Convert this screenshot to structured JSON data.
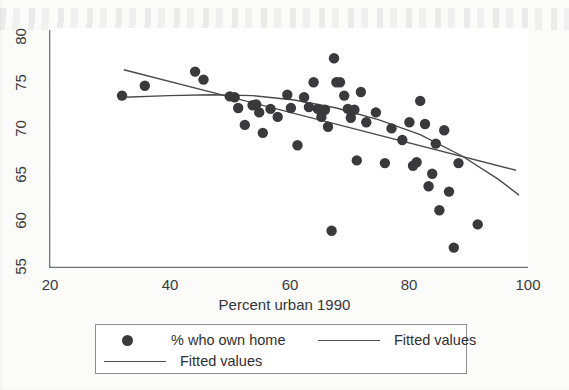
{
  "chart_data": {
    "type": "scatter",
    "title": "",
    "xlabel": "Percent urban 1990",
    "ylabel": "",
    "xlim": [
      20,
      100
    ],
    "ylim": [
      54,
      81
    ],
    "xticks": [
      20,
      40,
      60,
      80,
      100
    ],
    "yticks": [
      55,
      60,
      65,
      70,
      75,
      80
    ],
    "grid": false,
    "legend_position": "bottom",
    "marker_color": "#3a3a3c",
    "line_color": "#4a4a4e",
    "series": [
      {
        "name": "% who own home",
        "type": "scatter",
        "points": [
          [
            32.2,
            73.4
          ],
          [
            36.0,
            74.5
          ],
          [
            44.4,
            76.1
          ],
          [
            45.8,
            75.2
          ],
          [
            50.2,
            73.3
          ],
          [
            51.0,
            73.2
          ],
          [
            51.6,
            72.0
          ],
          [
            52.7,
            70.1
          ],
          [
            54.0,
            72.3
          ],
          [
            54.6,
            72.4
          ],
          [
            55.1,
            71.5
          ],
          [
            55.7,
            69.2
          ],
          [
            57.0,
            71.9
          ],
          [
            58.2,
            71.0
          ],
          [
            59.8,
            73.5
          ],
          [
            60.4,
            72.0
          ],
          [
            61.5,
            67.8
          ],
          [
            62.6,
            73.2
          ],
          [
            63.4,
            72.1
          ],
          [
            64.2,
            74.9
          ],
          [
            64.9,
            71.9
          ],
          [
            65.5,
            71.0
          ],
          [
            66.1,
            71.8
          ],
          [
            66.6,
            69.9
          ],
          [
            67.2,
            58.2
          ],
          [
            67.6,
            77.6
          ],
          [
            68.0,
            74.9
          ],
          [
            68.6,
            74.9
          ],
          [
            69.3,
            73.4
          ],
          [
            69.9,
            71.9
          ],
          [
            70.4,
            70.9
          ],
          [
            71.0,
            71.8
          ],
          [
            71.4,
            66.1
          ],
          [
            72.1,
            73.8
          ],
          [
            73.0,
            70.4
          ],
          [
            74.6,
            71.5
          ],
          [
            76.1,
            65.8
          ],
          [
            77.2,
            69.7
          ],
          [
            79.0,
            68.4
          ],
          [
            80.2,
            70.4
          ],
          [
            80.8,
            65.5
          ],
          [
            81.4,
            65.9
          ],
          [
            82.0,
            72.8
          ],
          [
            82.8,
            70.2
          ],
          [
            83.4,
            63.2
          ],
          [
            84.0,
            64.6
          ],
          [
            84.6,
            68.0
          ],
          [
            85.2,
            60.5
          ],
          [
            86.0,
            69.5
          ],
          [
            86.8,
            62.6
          ],
          [
            87.6,
            56.3
          ],
          [
            88.4,
            65.8
          ],
          [
            91.6,
            58.9
          ]
        ]
      },
      {
        "name": "Fitted values",
        "type": "line",
        "style": "linear",
        "points": [
          [
            32.5,
            76.3
          ],
          [
            98.0,
            65.0
          ]
        ]
      },
      {
        "name": "Fitted values",
        "type": "line",
        "style": "quadratic",
        "points": [
          [
            32.5,
            73.2
          ],
          [
            40,
            73.4
          ],
          [
            47,
            73.5
          ],
          [
            54,
            73.4
          ],
          [
            61,
            72.9
          ],
          [
            68,
            72.0
          ],
          [
            75,
            70.7
          ],
          [
            82,
            69.0
          ],
          [
            89,
            66.6
          ],
          [
            95,
            64.0
          ],
          [
            98.5,
            62.2
          ]
        ]
      }
    ]
  },
  "axes": {
    "x_title": "Percent urban 1990",
    "x_tick_labels": [
      "20",
      "40",
      "60",
      "80",
      "100"
    ],
    "y_tick_labels": [
      "55",
      "60",
      "65",
      "70",
      "75",
      "80"
    ]
  },
  "legend": {
    "entries": [
      {
        "label": "% who own home",
        "marker": "dot"
      },
      {
        "label": "Fitted values",
        "marker": "line"
      },
      {
        "label": "Fitted values",
        "marker": "line"
      }
    ]
  }
}
